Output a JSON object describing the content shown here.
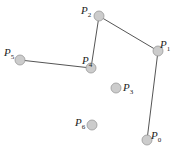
{
  "diagram": {
    "type": "point-polyline",
    "stroke_color": "#555555",
    "point_fill": "#cccccc",
    "point_stroke": "#999999",
    "point_radius": 5,
    "points": [
      {
        "id": "P0",
        "base": "P",
        "sub": "0",
        "x": 147,
        "y": 140,
        "label_x": 151,
        "label_y": 135
      },
      {
        "id": "P1",
        "base": "P",
        "sub": "1",
        "x": 158,
        "y": 51,
        "label_x": 160,
        "label_y": 44
      },
      {
        "id": "P2",
        "base": "P",
        "sub": "2",
        "x": 99,
        "y": 16,
        "label_x": 81,
        "label_y": 10
      },
      {
        "id": "P3",
        "base": "P",
        "sub": "3",
        "x": 116,
        "y": 88,
        "label_x": 123,
        "label_y": 87
      },
      {
        "id": "P4",
        "base": "P",
        "sub": "4",
        "x": 91,
        "y": 68,
        "label_x": 82,
        "label_y": 60
      },
      {
        "id": "P5",
        "base": "P",
        "sub": "5",
        "x": 20,
        "y": 60,
        "label_x": 4,
        "label_y": 52
      },
      {
        "id": "P6",
        "base": "P",
        "sub": "6",
        "x": 92,
        "y": 125,
        "label_x": 75,
        "label_y": 122
      }
    ],
    "polyline": [
      "P0",
      "P1",
      "P2",
      "P4",
      "P5"
    ]
  }
}
